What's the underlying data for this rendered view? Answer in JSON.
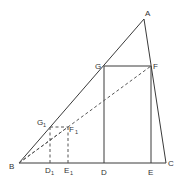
{
  "diagram": {
    "points": {
      "A": {
        "label": "A",
        "x": 144,
        "y": 19
      },
      "B": {
        "label": "B",
        "x": 19,
        "y": 163
      },
      "C": {
        "label": "C",
        "x": 166,
        "y": 163
      },
      "G": {
        "label": "G",
        "x": 104,
        "y": 66
      },
      "F": {
        "label": "F",
        "x": 151,
        "y": 66
      },
      "D": {
        "label": "D",
        "x": 104,
        "y": 163
      },
      "E": {
        "label": "E",
        "x": 151,
        "y": 163
      },
      "G1": {
        "label": "G",
        "sub": "1",
        "x": 50,
        "y": 127
      },
      "F1": {
        "label": "F",
        "sub": "1",
        "x": 68,
        "y": 127
      },
      "D1": {
        "label": "D",
        "sub": "1",
        "x": 50,
        "y": 163
      },
      "E1": {
        "label": "E",
        "sub": "1",
        "x": 68,
        "y": 163
      }
    },
    "solid_segments": [
      "AB",
      "AC",
      "BC",
      "GF",
      "GD",
      "FE"
    ],
    "dashed_segments": [
      "BF",
      "G1F1",
      "G1D1",
      "F1E1",
      "BF1"
    ],
    "colors": {
      "line": "#3a3a3a",
      "dashed": "#555555",
      "text": "#333333",
      "background": "#ffffff"
    }
  }
}
